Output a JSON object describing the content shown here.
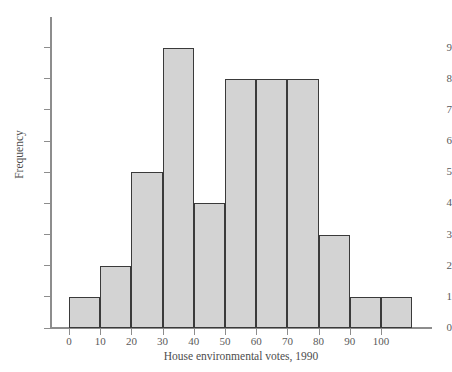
{
  "chart_data": {
    "type": "bar",
    "title": "",
    "subtitle": "",
    "xlabel": "House environmental votes, 1990",
    "ylabel": "Frequency",
    "categories": [
      "0-10",
      "10-20",
      "20-30",
      "30-40",
      "40-50",
      "50-60",
      "60-70",
      "70-80",
      "80-90",
      "90-100",
      "100-110"
    ],
    "bin_edges": [
      0,
      10,
      20,
      30,
      40,
      50,
      60,
      70,
      80,
      90,
      100,
      110
    ],
    "values": [
      1,
      2,
      5,
      9,
      4,
      8,
      8,
      8,
      3,
      1,
      1
    ],
    "bin_width": 10,
    "xlim": [
      -6,
      116
    ],
    "ylim": [
      0,
      9.4
    ],
    "xticks": [
      0,
      10,
      20,
      30,
      40,
      50,
      60,
      70,
      80,
      90,
      100
    ],
    "xtick_labels": [
      "0",
      "10",
      "20",
      "30",
      "40",
      "50",
      "60",
      "70",
      "80",
      "90",
      "100"
    ],
    "yticks": [
      0,
      1,
      2,
      3,
      4,
      5,
      6,
      7,
      8,
      9
    ],
    "ytick_labels": [
      "0",
      "1",
      "2",
      "3",
      "4",
      "5",
      "6",
      "7",
      "8",
      "9"
    ],
    "grid": false,
    "legend": null,
    "annotations": [],
    "colors": {
      "bar_fill": "#d3d3d3",
      "bar_edge": "#3a3a3a",
      "axis": "#8d8d8d",
      "text": "#4d4d4d",
      "background": "#ffffff"
    }
  }
}
